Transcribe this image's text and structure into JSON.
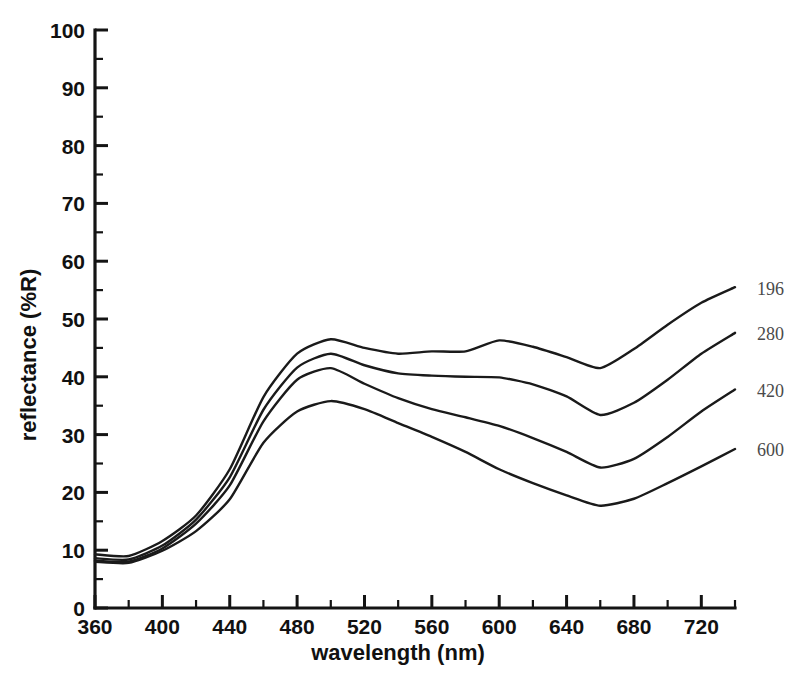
{
  "chart_data": {
    "type": "line",
    "title": "",
    "xlabel": "wavelength (nm)",
    "ylabel": "reflectance (%R)",
    "xlim": [
      360,
      740
    ],
    "ylim": [
      0,
      100
    ],
    "grid": false,
    "legend_position": "right-end-labels",
    "x_ticks": [
      360,
      400,
      440,
      480,
      520,
      560,
      600,
      640,
      680,
      720
    ],
    "x_tick_labels": [
      "360",
      "400",
      "440",
      "480",
      "520",
      "560",
      "600",
      "640",
      "680",
      "720"
    ],
    "x_minor_step": 20,
    "y_ticks": [
      0,
      10,
      20,
      30,
      40,
      50,
      60,
      70,
      80,
      90,
      100
    ],
    "y_tick_labels": [
      "0",
      "10",
      "20",
      "30",
      "40",
      "50",
      "60",
      "70",
      "80",
      "90",
      "100"
    ],
    "y_minor_step": 5,
    "x": [
      360,
      380,
      400,
      420,
      440,
      460,
      480,
      500,
      520,
      540,
      560,
      580,
      600,
      620,
      640,
      660,
      680,
      700,
      720,
      740
    ],
    "series": [
      {
        "name": "196",
        "label": "196",
        "values": [
          9.3,
          9.0,
          11.6,
          16.0,
          24.0,
          36.5,
          44.0,
          46.5,
          45.0,
          44.0,
          44.4,
          44.4,
          46.3,
          45.2,
          43.4,
          41.5,
          44.8,
          49.0,
          52.8,
          55.5
        ]
      },
      {
        "name": "280",
        "label": "280",
        "values": [
          8.6,
          8.4,
          10.8,
          15.3,
          22.6,
          34.3,
          41.6,
          44.0,
          42.0,
          40.6,
          40.2,
          40.0,
          39.9,
          38.7,
          36.6,
          33.4,
          35.5,
          39.5,
          44.0,
          47.6
        ]
      },
      {
        "name": "420",
        "label": "420",
        "values": [
          8.2,
          8.0,
          10.3,
          14.6,
          21.2,
          32.3,
          39.5,
          41.5,
          38.8,
          36.3,
          34.4,
          33.0,
          31.5,
          29.4,
          27.0,
          24.3,
          25.8,
          29.6,
          34.0,
          37.8
        ]
      },
      {
        "name": "600",
        "label": "600",
        "values": [
          8.0,
          7.8,
          9.9,
          13.3,
          18.8,
          28.6,
          34.0,
          35.8,
          34.4,
          32.0,
          29.6,
          27.0,
          24.0,
          21.6,
          19.5,
          17.7,
          18.9,
          21.6,
          24.5,
          27.5
        ]
      }
    ],
    "series_label_positions": [
      {
        "name": "196",
        "y_value": 55.2
      },
      {
        "name": "280",
        "y_value": 47.4
      },
      {
        "name": "420",
        "y_value": 37.6
      },
      {
        "name": "600",
        "y_value": 27.3
      }
    ]
  }
}
